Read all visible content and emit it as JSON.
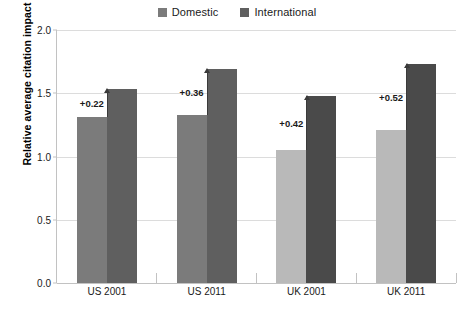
{
  "chart_data": {
    "type": "bar",
    "title": "",
    "xlabel": "",
    "ylabel": "Relative average citation impact",
    "ylim": [
      0.0,
      2.0
    ],
    "ytick_labels": [
      "0.0",
      "0.5",
      "1.0",
      "1.5",
      "2.0"
    ],
    "ytick_values": [
      0.0,
      0.5,
      1.0,
      1.5,
      2.0
    ],
    "grid": true,
    "legend_position": "top-center",
    "categories": [
      "US 2001",
      "US 2011",
      "UK 2001",
      "UK 2011"
    ],
    "series": [
      {
        "name": "Domestic",
        "values": [
          1.31,
          1.33,
          1.05,
          1.21
        ],
        "colors": [
          "#7b7b7b",
          "#7b7b7b",
          "#b9b9b9",
          "#b9b9b9"
        ]
      },
      {
        "name": "International",
        "values": [
          1.53,
          1.69,
          1.48,
          1.73
        ],
        "colors": [
          "#5f5f5f",
          "#5f5f5f",
          "#4a4a4a",
          "#4a4a4a"
        ]
      }
    ],
    "annotations": [
      {
        "label": "+0.22",
        "category": "US 2001",
        "from": 1.31,
        "to": 1.53
      },
      {
        "label": "+0.36",
        "category": "US 2011",
        "from": 1.33,
        "to": 1.69
      },
      {
        "label": "+0.42",
        "category": "UK 2001",
        "from": 1.05,
        "to": 1.48
      },
      {
        "label": "+0.52",
        "category": "UK 2011",
        "from": 1.21,
        "to": 1.73
      }
    ]
  },
  "legend": {
    "items": [
      {
        "label": "Domestic",
        "color": "#7b7b7b"
      },
      {
        "label": "International",
        "color": "#5f5f5f"
      }
    ]
  }
}
